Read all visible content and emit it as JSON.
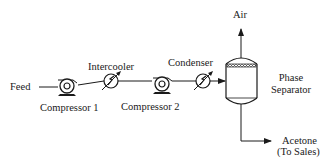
{
  "diagram": {
    "type": "process-flow-diagram",
    "streams": {
      "feed": "Feed",
      "air": "Air",
      "acetone_line1": "Acetone",
      "acetone_line2": "(To Sales)"
    },
    "equipment": {
      "compressor1": "Compressor 1",
      "intercooler": "Intercooler",
      "compressor2": "Compressor  2",
      "condenser": "Condenser",
      "separator_line1": "Phase",
      "separator_line2": "Separator"
    },
    "connections": [
      {
        "from": "Feed",
        "to": "Compressor 1"
      },
      {
        "from": "Compressor 1",
        "to": "Intercooler"
      },
      {
        "from": "Intercooler",
        "to": "Compressor 2"
      },
      {
        "from": "Compressor 2",
        "to": "Condenser"
      },
      {
        "from": "Condenser",
        "to": "Phase Separator"
      },
      {
        "from": "Phase Separator",
        "to": "Air"
      },
      {
        "from": "Phase Separator",
        "to": "Acetone (To Sales)"
      }
    ],
    "colors": {
      "line": "#1a1a1a",
      "background": "#ffffff"
    }
  }
}
